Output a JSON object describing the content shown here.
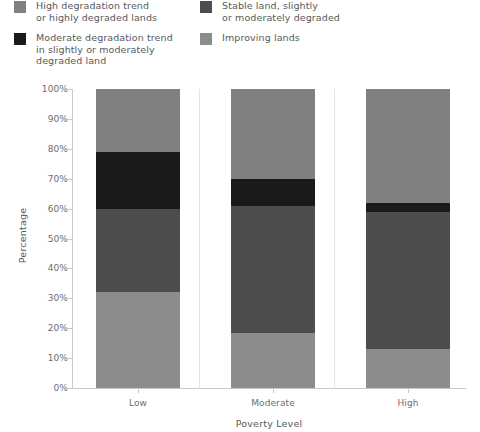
{
  "legend": {
    "columns": [
      {
        "items": [
          {
            "label": "High degradation trend\nor highly degraded lands",
            "color": "#808080",
            "swatch_name": "legend-swatch-high-degradation"
          },
          {
            "label": "Moderate degradation trend\nin slightly or moderately\ndegraded land",
            "color": "#1a1a1a",
            "swatch_name": "legend-swatch-moderate-degradation"
          }
        ]
      },
      {
        "items": [
          {
            "label": "Stable land, slightly\nor moderately degraded",
            "color": "#4d4d4d",
            "swatch_name": "legend-swatch-stable-land"
          },
          {
            "label": "Improving lands",
            "color": "#8c8c8c",
            "swatch_name": "legend-swatch-improving-lands"
          }
        ]
      }
    ]
  },
  "chart_data": {
    "type": "bar",
    "stacked": true,
    "stack_total": 100,
    "title": "",
    "xlabel": "Poverty Level",
    "ylabel": "Percentage",
    "categories": [
      "Low",
      "Moderate",
      "High"
    ],
    "ylim": [
      0,
      100
    ],
    "ytick_labels": [
      "0%",
      "10%",
      "20%",
      "30%",
      "40%",
      "50%",
      "60%",
      "70%",
      "80%",
      "90%",
      "100%"
    ],
    "ytick_values": [
      0,
      10,
      20,
      30,
      40,
      50,
      60,
      70,
      80,
      90,
      100
    ],
    "grid": false,
    "legend_position": "top",
    "series": [
      {
        "name": "Improving lands",
        "color": "#8c8c8c",
        "values": [
          32,
          18.5,
          13
        ]
      },
      {
        "name": "Stable land, slightly or moderately degraded",
        "color": "#4d4d4d",
        "values": [
          28,
          42.5,
          46
        ]
      },
      {
        "name": "Moderate degradation trend in slightly or moderately degraded land",
        "color": "#1a1a1a",
        "values": [
          19,
          9,
          3
        ]
      },
      {
        "name": "High degradation trend or highly degraded lands",
        "color": "#808080",
        "values": [
          21,
          30,
          38
        ]
      }
    ]
  }
}
